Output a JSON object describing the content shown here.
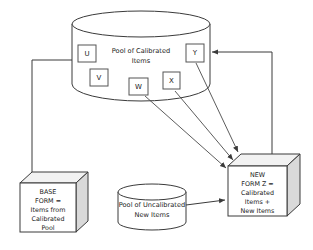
{
  "diagram": {
    "colors": {
      "stroke": "#3a3a3a",
      "box_side_face": "#d9d9d9",
      "box_top_face": "#f2f2f2",
      "background": "#ffffff",
      "text": "#1a1a1a"
    },
    "nodes": {
      "calibrated_pool": {
        "shape": "cylinder",
        "label_line1": "Pool of Calibrated",
        "label_line2": "Items"
      },
      "uncalibrated_pool": {
        "shape": "cylinder",
        "label_line1": "Pool of Uncalibrated",
        "label_line2": "New Items"
      },
      "base_form": {
        "shape": "cube",
        "label_line1": "BASE",
        "label_line2": "FORM =",
        "label_line3": "Items from",
        "label_line4": "Calibrated",
        "label_line5": "Pool"
      },
      "new_form": {
        "shape": "cube",
        "label_line1": "NEW",
        "label_line2": "FORM Z =",
        "label_line3": "Calibrated",
        "label_line4": "Items +",
        "label_line5": "New Items"
      }
    },
    "items": [
      {
        "id": "item-u",
        "label": "U"
      },
      {
        "id": "item-v",
        "label": "V"
      },
      {
        "id": "item-w",
        "label": "W"
      },
      {
        "id": "item-x",
        "label": "X"
      },
      {
        "id": "item-y",
        "label": "Y"
      }
    ],
    "connectors": [
      {
        "id": "pool-to-base-form",
        "from": "calibrated_pool",
        "to": "base_form",
        "arrowhead": false
      },
      {
        "id": "item-w-to-new-form",
        "from": "item-w",
        "to": "new_form",
        "arrowhead": true
      },
      {
        "id": "item-x-to-new-form",
        "from": "item-x",
        "to": "new_form",
        "arrowhead": true
      },
      {
        "id": "item-y-to-new-form",
        "from": "item-y",
        "to": "new_form",
        "arrowhead": true
      },
      {
        "id": "uncalibrated-pool-to-new-form",
        "from": "uncalibrated_pool",
        "to": "new_form",
        "arrowhead": true
      },
      {
        "id": "new-form-to-calibrated-pool",
        "from": "new_form",
        "to": "calibrated_pool",
        "arrowhead": true
      }
    ]
  }
}
